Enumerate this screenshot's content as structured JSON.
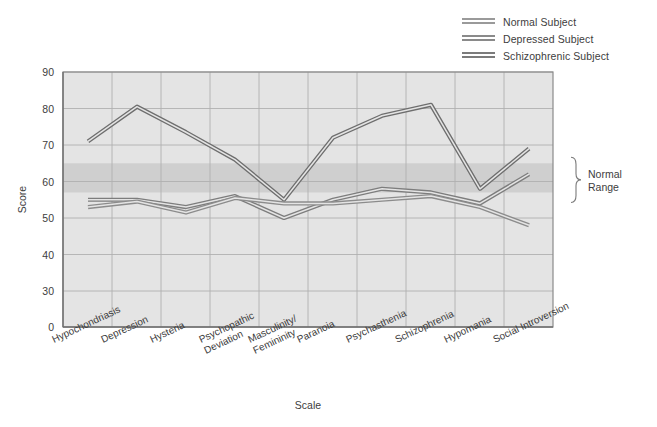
{
  "chart_data": {
    "type": "line",
    "title": "",
    "xlabel": "Scale",
    "ylabel": "Score",
    "categories": [
      "Hypochondriasis",
      "Depression",
      "Hysteria",
      "Psychopathic\nDeviation",
      "Masculinity/\nFemininity",
      "Paranoia",
      "Psychasthenia",
      "Schizophrenia",
      "Hypomania",
      "Social Introversion"
    ],
    "series": [
      {
        "name": "Normal Subject",
        "color": "#8c8c8c",
        "values": [
          53,
          54.5,
          51.5,
          55.5,
          54,
          54,
          55,
          56,
          53,
          48
        ]
      },
      {
        "name": "Depressed Subject",
        "color": "#7d7d7d",
        "values": [
          55,
          55,
          53,
          56,
          50,
          55,
          58,
          57,
          54,
          62
        ]
      },
      {
        "name": "Schizophrenic Subject",
        "color": "#6e6e6e",
        "values": [
          71,
          80.5,
          73.5,
          66,
          55,
          72,
          78,
          81,
          58,
          69
        ]
      }
    ],
    "yticks": [
      90,
      80,
      70,
      60,
      50,
      40,
      30,
      0
    ],
    "ylim": [
      30,
      90
    ],
    "y_axis_broken": true,
    "grid": true,
    "legend_position": "top-right",
    "annotations": [
      {
        "name": "normal-range",
        "text": "Normal\nRange",
        "line1": "Normal",
        "line2": "Range",
        "band_low": 57,
        "band_high": 65
      }
    ]
  },
  "legend": {
    "items": [
      {
        "label": "Normal Subject"
      },
      {
        "label": "Depressed Subject"
      },
      {
        "label": "Schizophrenic Subject"
      }
    ]
  },
  "axes": {
    "y_title": "Score",
    "x_title": "Scale",
    "y_ticks": [
      "90",
      "80",
      "70",
      "60",
      "50",
      "40",
      "30",
      "0"
    ]
  },
  "annotation": {
    "normal_range_line1": "Normal",
    "normal_range_line2": "Range"
  },
  "colors": {
    "plot_background": "#e4e4e4",
    "band": "#cfcfcf",
    "grid": "#b0b0b0",
    "axis": "#8a8a8a",
    "text": "#3d3d3d",
    "series_normal": "#8c8c8c",
    "series_depressed": "#7d7d7d",
    "series_schizophrenic": "#6e6e6e"
  }
}
